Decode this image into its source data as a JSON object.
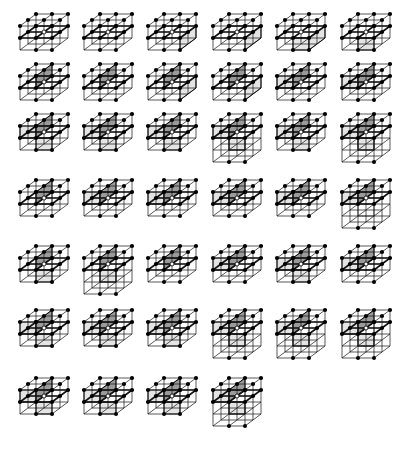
{
  "figure": {
    "rows": [
      {
        "y": 12,
        "cells": [
          {
            "x": 16,
            "tall": false,
            "faces": [
              "h"
            ]
          },
          {
            "x": 80,
            "tall": false,
            "faces": [
              "h"
            ]
          },
          {
            "x": 144,
            "tall": false,
            "faces": [
              "h",
              "fr"
            ]
          },
          {
            "x": 209,
            "tall": false,
            "faces": [
              "h",
              "fr"
            ]
          },
          {
            "x": 273,
            "tall": false,
            "faces": [
              "h",
              "fl",
              "fr"
            ]
          },
          {
            "x": 338,
            "tall": false,
            "faces": [
              "h",
              "fl"
            ]
          }
        ]
      },
      {
        "y": 62,
        "cells": [
          {
            "x": 16,
            "tall": false,
            "faces": [
              "v",
              "h"
            ]
          },
          {
            "x": 80,
            "tall": false,
            "faces": [
              "v",
              "h"
            ]
          },
          {
            "x": 144,
            "tall": false,
            "faces": [
              "v",
              "h",
              "fr"
            ]
          },
          {
            "x": 209,
            "tall": false,
            "faces": [
              "v",
              "h",
              "fr"
            ]
          },
          {
            "x": 273,
            "tall": false,
            "faces": [
              "v",
              "h",
              "ul"
            ]
          },
          {
            "x": 338,
            "tall": false,
            "faces": [
              "v",
              "h",
              "ul"
            ]
          }
        ]
      },
      {
        "y": 112,
        "cells": [
          {
            "x": 16,
            "tall": false,
            "faces": [
              "v",
              "ul",
              "fl"
            ]
          },
          {
            "x": 80,
            "tall": false,
            "faces": [
              "v",
              "ul",
              "fl"
            ]
          },
          {
            "x": 144,
            "tall": false,
            "faces": [
              "v",
              "ul",
              "fl"
            ]
          },
          {
            "x": 209,
            "tall": true,
            "faces": [
              "v",
              "ul",
              "fl"
            ]
          },
          {
            "x": 273,
            "tall": false,
            "faces": [
              "v",
              "ul",
              "fl"
            ]
          },
          {
            "x": 338,
            "tall": true,
            "faces": [
              "v",
              "ul",
              "fl"
            ]
          }
        ]
      },
      {
        "y": 178,
        "cells": [
          {
            "x": 16,
            "tall": false,
            "faces": [
              "v",
              "h"
            ]
          },
          {
            "x": 80,
            "tall": false,
            "faces": [
              "v",
              "h",
              "ul"
            ]
          },
          {
            "x": 144,
            "tall": false,
            "faces": [
              "v",
              "h",
              "ul"
            ]
          },
          {
            "x": 209,
            "tall": false,
            "faces": [
              "v",
              "h",
              "ul"
            ]
          },
          {
            "x": 273,
            "tall": false,
            "faces": [
              "v",
              "h",
              "ul"
            ]
          },
          {
            "x": 338,
            "tall": true,
            "faces": [
              "v",
              "h",
              "ul"
            ]
          }
        ]
      },
      {
        "y": 244,
        "cells": [
          {
            "x": 16,
            "tall": false,
            "faces": [
              "v",
              "fl"
            ]
          },
          {
            "x": 80,
            "tall": true,
            "faces": [
              "v",
              "fl"
            ]
          },
          {
            "x": 144,
            "tall": false,
            "faces": [
              "v"
            ]
          },
          {
            "x": 209,
            "tall": false,
            "faces": [
              "v",
              "ul"
            ]
          },
          {
            "x": 273,
            "tall": false,
            "faces": [
              "v",
              "ul",
              "fl"
            ]
          },
          {
            "x": 338,
            "tall": false,
            "faces": [
              "v",
              "ul"
            ]
          }
        ]
      },
      {
        "y": 308,
        "cells": [
          {
            "x": 16,
            "tall": false,
            "faces": [
              "v",
              "ul",
              "fl"
            ]
          },
          {
            "x": 80,
            "tall": false,
            "faces": [
              "v",
              "ul",
              "fl"
            ]
          },
          {
            "x": 144,
            "tall": false,
            "faces": [
              "v",
              "ul",
              "fl"
            ]
          },
          {
            "x": 209,
            "tall": true,
            "faces": [
              "v",
              "ul",
              "fl"
            ]
          },
          {
            "x": 273,
            "tall": true,
            "faces": [
              "v",
              "ul",
              "fl"
            ]
          },
          {
            "x": 338,
            "tall": true,
            "faces": [
              "v",
              "ul",
              "fl"
            ]
          }
        ]
      },
      {
        "y": 376,
        "cells": [
          {
            "x": 16,
            "tall": false,
            "faces": [
              "v",
              "ul",
              "fl"
            ]
          },
          {
            "x": 80,
            "tall": false,
            "faces": [
              "v",
              "ul",
              "fl"
            ]
          },
          {
            "x": 144,
            "tall": false,
            "faces": [
              "v",
              "ul",
              "fl"
            ]
          },
          {
            "x": 209,
            "tall": true,
            "faces": [
              "v",
              "ul",
              "fl"
            ]
          }
        ]
      }
    ],
    "colors": {
      "line": "#111111",
      "dark_face": "#9a9a9a",
      "light_face": "#e4e4e4",
      "node": "#000000",
      "center": "#ffffff"
    }
  }
}
